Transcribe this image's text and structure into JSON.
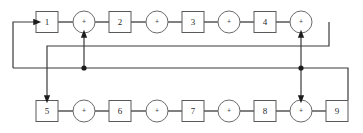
{
  "diagram": {
    "colors": {
      "background": "#ffffff",
      "box_stroke": "#5a5a5a",
      "circle_stroke": "#6b6b6b",
      "link_stroke": "#4a4a4a",
      "route_stroke": "#3a3a3a",
      "junction_fill": "#1c1c1c",
      "label_fill": "#2b2b2b"
    },
    "rows": [
      {
        "name": "top-row",
        "y": 22,
        "nodes": [
          {
            "kind": "box",
            "label": "1",
            "cx": 47,
            "name": "block-1"
          },
          {
            "kind": "circle",
            "label": "+",
            "cx": 84,
            "name": "summing-junction-a"
          },
          {
            "kind": "box",
            "label": "2",
            "cx": 120,
            "name": "block-2"
          },
          {
            "kind": "circle",
            "label": "+",
            "cx": 157,
            "name": "summing-junction-b"
          },
          {
            "kind": "box",
            "label": "3",
            "cx": 193,
            "name": "block-3"
          },
          {
            "kind": "circle",
            "label": "+",
            "cx": 229,
            "name": "summing-junction-c"
          },
          {
            "kind": "box",
            "label": "4",
            "cx": 265,
            "name": "block-4"
          },
          {
            "kind": "circle",
            "label": "+",
            "cx": 301,
            "name": "summing-junction-d"
          }
        ]
      },
      {
        "name": "bottom-row",
        "y": 111,
        "nodes": [
          {
            "kind": "box",
            "label": "5",
            "cx": 47,
            "name": "block-5"
          },
          {
            "kind": "circle",
            "label": "+",
            "cx": 84,
            "name": "summing-junction-e"
          },
          {
            "kind": "box",
            "label": "6",
            "cx": 120,
            "name": "block-6"
          },
          {
            "kind": "circle",
            "label": "+",
            "cx": 157,
            "name": "summing-junction-f"
          },
          {
            "kind": "box",
            "label": "7",
            "cx": 193,
            "name": "block-7"
          },
          {
            "kind": "circle",
            "label": "+",
            "cx": 229,
            "name": "summing-junction-g"
          },
          {
            "kind": "box",
            "label": "8",
            "cx": 265,
            "name": "block-8"
          },
          {
            "kind": "circle",
            "label": "+",
            "cx": 301,
            "name": "summing-junction-h"
          },
          {
            "kind": "box",
            "label": "9",
            "cx": 337,
            "name": "block-9"
          }
        ]
      }
    ],
    "junction_dots": [
      {
        "name": "junction-dot-left",
        "cx": 84,
        "cy": 68
      },
      {
        "name": "junction-dot-right",
        "cx": 301,
        "cy": 68
      }
    ],
    "feedback_paths": [
      {
        "name": "feedback-path-outer-left",
        "description": "from lower bus leftward, up the far-left column and into block 1",
        "points": "13,68 13,22 36,22"
      },
      {
        "name": "feedback-path-upper-bus",
        "description": "upper horizontal bus from the top-right summing junction leftward, then down into block 5",
        "points": "47,111 47,46 329,46 329,22"
      },
      {
        "name": "feedback-path-lower-bus",
        "description": "lower horizontal bus from block 9 leftward to the far-left column",
        "points": "13,68 348,68 348,100"
      },
      {
        "name": "feedback-path-left-riser",
        "description": "vertical riser from lower bus up into top-row summing junction a",
        "points": "84,68 84,34"
      },
      {
        "name": "feedback-path-right-riser",
        "description": "vertical riser from lower bus up into top-row summing junction d",
        "points": "301,68 301,34"
      },
      {
        "name": "feedback-path-right-drop",
        "description": "vertical drop from lower bus down into bottom-row summing junction h",
        "points": "301,68 301,99"
      }
    ],
    "arrows": [
      {
        "name": "arrow-into-block-1",
        "direction": "right",
        "x": 37,
        "y": 22
      },
      {
        "name": "arrow-into-summing-junction-a",
        "direction": "up",
        "x": 84,
        "y": 34
      },
      {
        "name": "arrow-into-summing-junction-d",
        "direction": "up",
        "x": 301,
        "y": 34
      },
      {
        "name": "arrow-into-block-5",
        "direction": "down",
        "x": 47,
        "y": 99
      },
      {
        "name": "arrow-into-summing-junction-h",
        "direction": "down",
        "x": 301,
        "y": 99
      }
    ]
  }
}
